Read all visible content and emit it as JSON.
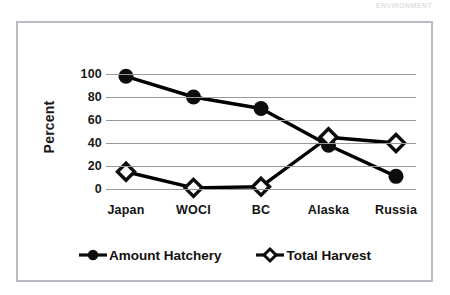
{
  "running_head": "ENVIRONMENT",
  "chart_data": {
    "type": "line",
    "title": "",
    "xlabel": "",
    "ylabel": "Percent",
    "categories": [
      "Japan",
      "WOCI",
      "BC",
      "Alaska",
      "Russia"
    ],
    "yticks": [
      0,
      20,
      40,
      60,
      80,
      100
    ],
    "ylim": [
      0,
      100
    ],
    "grid": "horizontal",
    "legend_position": "bottom",
    "series": [
      {
        "name": "Amount Hatchery",
        "marker": "filled-circle",
        "color": "#000000",
        "values": [
          98,
          80,
          70,
          38,
          11
        ]
      },
      {
        "name": "Total Harvest",
        "marker": "open-diamond",
        "color": "#000000",
        "values": [
          15,
          1,
          2,
          45,
          40
        ]
      }
    ]
  },
  "legend": {
    "items": [
      {
        "label": "Amount Hatchery",
        "marker": "filled-circle"
      },
      {
        "label": "Total Harvest",
        "marker": "open-diamond"
      }
    ]
  }
}
